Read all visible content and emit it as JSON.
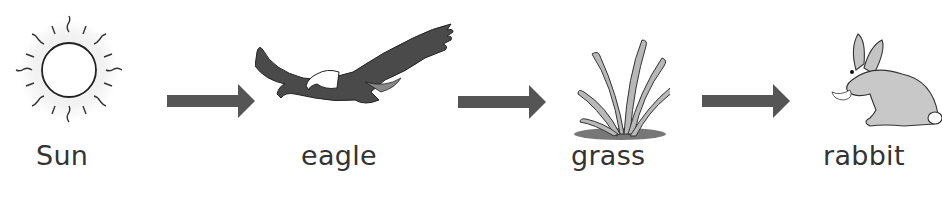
{
  "diagram": {
    "type": "food-chain",
    "nodes": [
      {
        "id": "sun",
        "label": "Sun",
        "icon": "sun-icon"
      },
      {
        "id": "eagle",
        "label": "eagle",
        "icon": "eagle-icon"
      },
      {
        "id": "grass",
        "label": "grass",
        "icon": "grass-icon"
      },
      {
        "id": "rabbit",
        "label": "rabbit",
        "icon": "rabbit-icon"
      }
    ],
    "edges": [
      {
        "from": "sun",
        "to": "eagle",
        "icon": "arrow-right-icon"
      },
      {
        "from": "eagle",
        "to": "grass",
        "icon": "arrow-right-icon"
      },
      {
        "from": "grass",
        "to": "rabbit",
        "icon": "arrow-right-icon"
      }
    ],
    "colors": {
      "arrow": "#555555",
      "text": "#333333"
    }
  }
}
